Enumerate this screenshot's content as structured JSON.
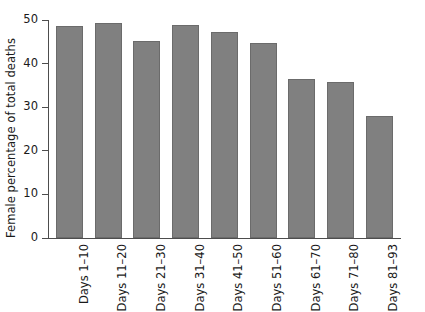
{
  "chart_data": {
    "type": "bar",
    "title": "",
    "subtitle": "",
    "xlabel": "",
    "ylabel": "Female percentage of total deaths",
    "categories": [
      "Days 1–10",
      "Days 11–20",
      "Days 21–30",
      "Days 31–40",
      "Days 41–50",
      "Days 51–60",
      "Days 61–70",
      "Days 71–80",
      "Days 81–93"
    ],
    "values": [
      48.6,
      49.3,
      45.2,
      48.9,
      47.3,
      44.8,
      36.5,
      35.8,
      28.0
    ],
    "ylim": [
      0,
      50
    ],
    "yticks": [
      0,
      10,
      20,
      30,
      40,
      50
    ],
    "ytick_labels": [
      "0",
      "10",
      "20",
      "30",
      "40",
      "50"
    ],
    "grid": false,
    "legend": false,
    "legend_position": "none",
    "bar_color": "#808080",
    "bar_edge_color": "#6b6b6b",
    "axis_color": "#4d4d4d",
    "background_color": "#ffffff"
  }
}
